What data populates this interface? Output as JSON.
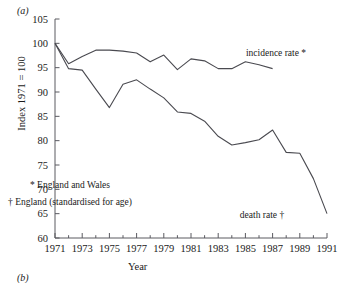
{
  "figure": {
    "panel_label": "(a)",
    "panel_label_next": "(b)",
    "ylabel": "Index 1971 = 100",
    "xlabel": "Year",
    "annotations": [
      {
        "name": "incidence-series-label",
        "text": "incidence rate *",
        "x": 276,
        "y": 56
      },
      {
        "name": "death-series-label",
        "text": "death rate †",
        "x": 262,
        "y": 218
      },
      {
        "name": "footnote-star",
        "text": "* England and Wales",
        "x": 70,
        "y": 188
      },
      {
        "name": "footnote-dagger",
        "text": "† England (standardised for age)",
        "x": 70,
        "y": 205
      }
    ]
  },
  "chart_data": {
    "type": "line",
    "title": "",
    "xlabel": "Year",
    "ylabel": "Index 1971 = 100",
    "xlim": [
      1971,
      1991
    ],
    "ylim": [
      60,
      105
    ],
    "ytick_labels": [
      "60",
      "65",
      "70",
      "75",
      "80",
      "85",
      "90",
      "95",
      "100",
      "105"
    ],
    "yticks": [
      60,
      65,
      70,
      75,
      80,
      85,
      90,
      95,
      100,
      105
    ],
    "xtick_labels": [
      "1971",
      "1973",
      "1975",
      "1977",
      "1979",
      "1981",
      "1983",
      "1985",
      "1987",
      "1989",
      "1991"
    ],
    "xticks": [
      1971,
      1973,
      1975,
      1977,
      1979,
      1981,
      1983,
      1985,
      1987,
      1989,
      1991
    ],
    "minor_xticks": [
      1972,
      1974,
      1976,
      1978,
      1980,
      1982,
      1984,
      1986,
      1988,
      1990
    ],
    "grid": false,
    "legend_position": "inline-labels",
    "series": [
      {
        "name": "incidence rate *",
        "x": [
          1971,
          1972,
          1973,
          1974,
          1975,
          1976,
          1977,
          1978,
          1979,
          1980,
          1981,
          1982,
          1983,
          1984,
          1985,
          1986,
          1987
        ],
        "values": [
          100.0,
          95.8,
          97.3,
          98.6,
          98.6,
          98.4,
          98.0,
          96.2,
          97.6,
          94.6,
          96.8,
          96.4,
          94.8,
          94.8,
          96.2,
          95.6,
          94.8
        ]
      },
      {
        "name": "death rate †",
        "x": [
          1971,
          1972,
          1973,
          1974,
          1975,
          1976,
          1977,
          1978,
          1979,
          1980,
          1981,
          1982,
          1983,
          1984,
          1985,
          1986,
          1987,
          1988,
          1989,
          1990,
          1991
        ],
        "values": [
          100.0,
          94.8,
          94.5,
          90.6,
          86.8,
          91.6,
          92.5,
          90.6,
          88.8,
          85.9,
          85.6,
          84.0,
          80.9,
          79.1,
          79.6,
          80.2,
          82.2,
          77.6,
          77.4,
          72.2,
          65.0
        ]
      }
    ]
  },
  "geometry": {
    "plot_left": 55,
    "plot_right": 327,
    "plot_top": 19,
    "plot_bottom": 238
  }
}
